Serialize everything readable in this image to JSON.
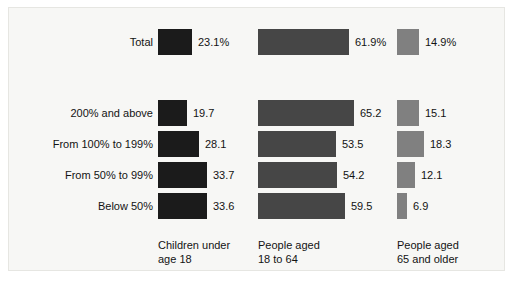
{
  "chart_data": {
    "type": "bar",
    "title": "",
    "xlabel": "",
    "ylabel": "",
    "orientation": "horizontal",
    "grid": false,
    "legend_position": "bottom",
    "axis_max_percent": 70,
    "categories": [
      "Total",
      "200% and above",
      "From 100% to 199%",
      "From 50% to 99%",
      "Below 50%"
    ],
    "series": [
      {
        "name": "Children under\nage 18",
        "color": "#1b1b1b",
        "values": [
          23.1,
          19.7,
          28.1,
          33.7,
          33.6
        ],
        "labels": [
          "23.1%",
          "19.7",
          "28.1",
          "33.7",
          "33.6"
        ]
      },
      {
        "name": "People aged\n18 to 64",
        "color": "#464646",
        "values": [
          61.9,
          65.2,
          53.5,
          54.2,
          59.5
        ],
        "labels": [
          "61.9%",
          "65.2",
          "53.5",
          "54.2",
          "59.5"
        ]
      },
      {
        "name": "People aged\n65 and older",
        "color": "#808080",
        "values": [
          14.9,
          15.1,
          18.3,
          12.1,
          6.9
        ],
        "labels": [
          "14.9%",
          "15.1",
          "18.3",
          "12.1",
          "6.9"
        ]
      }
    ]
  }
}
